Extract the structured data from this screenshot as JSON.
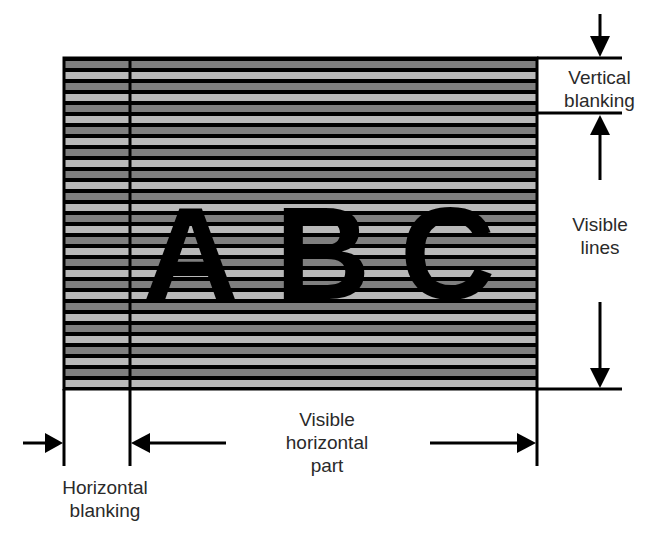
{
  "diagram": {
    "content_letters": [
      "A",
      "B",
      "C"
    ],
    "colors": {
      "background": "#ffffff",
      "line": "#000000",
      "stripe_dark": "#7f7f7f",
      "stripe_light": "#b9b9b9",
      "text": "#2a2a2a"
    },
    "labels": {
      "vertical_blanking": [
        "Vertical",
        "blanking"
      ],
      "visible_lines": [
        "Visible",
        "lines"
      ],
      "visible_horizontal_part": [
        "Visible",
        "horizontal",
        "part"
      ],
      "horizontal_blanking": [
        "Horizontal",
        "blanking"
      ]
    }
  }
}
